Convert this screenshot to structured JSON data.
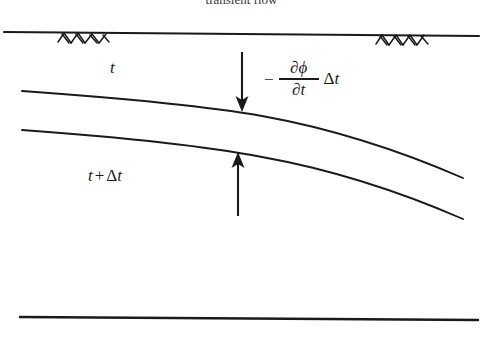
{
  "figure": {
    "caption": "transient flow",
    "background_color": "#ffffff",
    "ink_color": "#1a1a1a",
    "width": 483,
    "height": 344
  },
  "labels": {
    "upper_surface_time": "t",
    "lower_surface_time_prefix": "t",
    "lower_surface_time_op": "+",
    "lower_surface_time_delta": "Δ",
    "lower_surface_time_var": "t",
    "drawdown_minus": "−",
    "drawdown_numerator": "∂ϕ",
    "drawdown_denominator": "∂t",
    "drawdown_delta": "Δ",
    "drawdown_var": "t"
  },
  "geometry": {
    "ground_line": {
      "x1": 4,
      "y1": 32,
      "x2": 479,
      "y2": 36
    },
    "bedrock_line": {
      "x1": 20,
      "y1": 317,
      "x2": 478,
      "y2": 320
    },
    "hatch_left": {
      "x_start": 58,
      "x_end": 108,
      "y": 34,
      "count": 6
    },
    "hatch_right": {
      "x_start": 376,
      "x_end": 430,
      "y": 35,
      "count": 6
    },
    "water_table_t": {
      "x_start": 22,
      "y_start": 91,
      "x_end": 463,
      "y_end": 178
    },
    "water_table_t_dt": {
      "x_start": 22,
      "y_start": 130,
      "x_end": 463,
      "y_end": 219
    },
    "arrow_down": {
      "x": 242,
      "y_start": 52,
      "y_end": 110
    },
    "arrow_up": {
      "x": 238,
      "y_start": 216,
      "y_end": 154
    }
  }
}
